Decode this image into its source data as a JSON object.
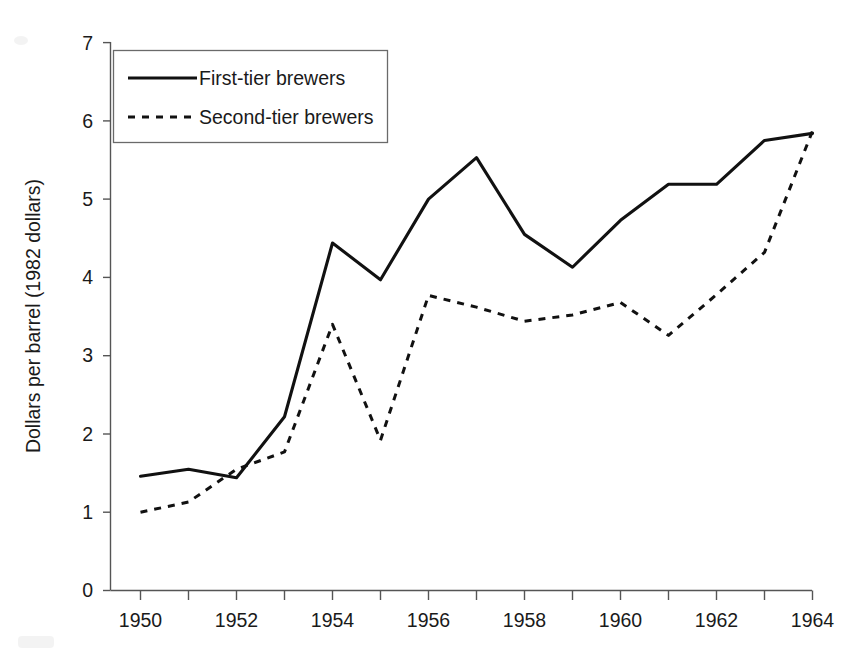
{
  "figure": {
    "background_color": "#ffffff",
    "ink_color": "#111111",
    "axis_color": "#555555"
  },
  "chart_data": {
    "type": "line",
    "title": "",
    "xlabel": "",
    "ylabel": "Dollars per barrel (1982 dollars)",
    "xlim": [
      1950,
      1964
    ],
    "ylim": [
      0,
      7
    ],
    "grid": false,
    "legend_position": "top-left",
    "x": [
      1950,
      1951,
      1952,
      1953,
      1954,
      1955,
      1956,
      1957,
      1958,
      1959,
      1960,
      1961,
      1962,
      1963,
      1964
    ],
    "x_tick_labels": [
      "1950",
      "1952",
      "1954",
      "1956",
      "1958",
      "1960",
      "1962",
      "1964"
    ],
    "x_tick_values": [
      1950,
      1952,
      1954,
      1956,
      1958,
      1960,
      1962,
      1964
    ],
    "y_tick_labels": [
      "0",
      "1",
      "2",
      "3",
      "4",
      "5",
      "6",
      "7"
    ],
    "y_tick_values": [
      0,
      1,
      2,
      3,
      4,
      5,
      6,
      7
    ],
    "series": [
      {
        "name": "First-tier brewers",
        "style": "solid",
        "values": [
          1.46,
          1.55,
          1.44,
          2.22,
          4.44,
          3.97,
          5.0,
          5.53,
          4.55,
          4.13,
          4.73,
          5.19,
          5.19,
          5.75,
          5.84
        ]
      },
      {
        "name": "Second-tier brewers",
        "style": "dashed",
        "values": [
          1.0,
          1.13,
          1.55,
          1.77,
          3.4,
          1.92,
          3.77,
          3.62,
          3.44,
          3.52,
          3.68,
          3.26,
          3.78,
          4.32,
          5.87
        ]
      }
    ]
  },
  "legend": {
    "entries": [
      {
        "label": "First-tier brewers",
        "style": "solid"
      },
      {
        "label": "Second-tier brewers",
        "style": "dashed"
      }
    ]
  }
}
